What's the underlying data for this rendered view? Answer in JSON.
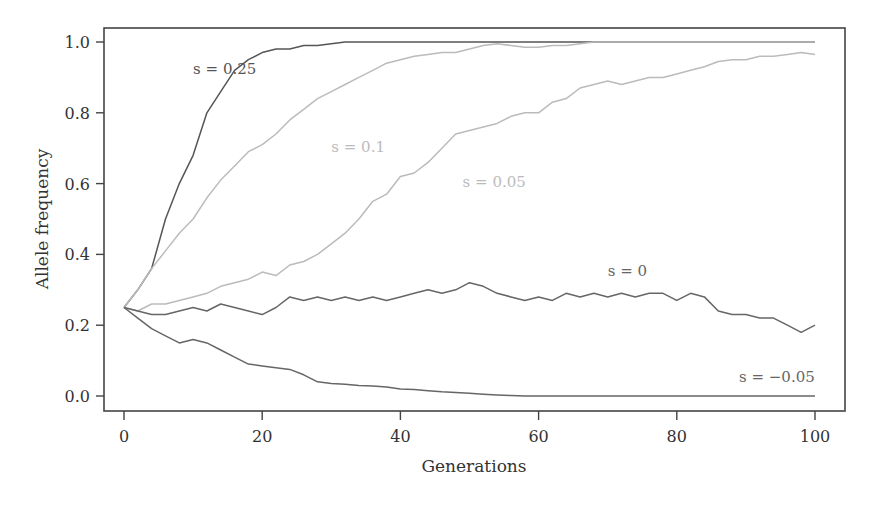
{
  "chart_data": {
    "type": "line",
    "title": "",
    "xlabel": "Generations",
    "ylabel": "Allele frequency",
    "xlim": [
      0,
      100
    ],
    "ylim": [
      0.0,
      1.0
    ],
    "xticks": [
      0,
      20,
      40,
      60,
      80,
      100
    ],
    "yticks": [
      0.0,
      0.2,
      0.4,
      0.6,
      0.8,
      1.0
    ],
    "ytick_labels": [
      "0.0",
      "0.2",
      "0.4",
      "0.6",
      "0.8",
      "1.0"
    ],
    "grid": false,
    "legend": "inline labels",
    "x": [
      0,
      2,
      4,
      6,
      8,
      10,
      12,
      14,
      16,
      18,
      20,
      22,
      24,
      26,
      28,
      30,
      32,
      34,
      36,
      38,
      40,
      42,
      44,
      46,
      48,
      50,
      52,
      54,
      56,
      58,
      60,
      62,
      64,
      66,
      68,
      70,
      72,
      74,
      76,
      78,
      80,
      82,
      84,
      86,
      88,
      90,
      92,
      94,
      96,
      98,
      100
    ],
    "series": [
      {
        "name": "s = 0.25",
        "color": "#555555",
        "label_pos": [
          10,
          0.91
        ],
        "values": [
          0.25,
          0.3,
          0.36,
          0.5,
          0.6,
          0.68,
          0.8,
          0.86,
          0.92,
          0.95,
          0.97,
          0.98,
          0.98,
          0.99,
          0.99,
          0.995,
          1.0,
          1.0,
          1.0,
          1.0,
          1.0,
          1.0,
          1.0,
          1.0,
          1.0,
          1.0,
          1.0,
          1.0,
          1.0,
          1.0,
          1.0,
          1.0,
          1.0,
          1.0,
          1.0,
          1.0,
          1.0,
          1.0,
          1.0,
          1.0,
          1.0,
          1.0,
          1.0,
          1.0,
          1.0,
          1.0,
          1.0,
          1.0,
          1.0,
          1.0,
          1.0
        ]
      },
      {
        "name": "s = 0.1",
        "color": "#bbbbbb",
        "label_pos": [
          30,
          0.69
        ],
        "values": [
          0.25,
          0.3,
          0.36,
          0.41,
          0.46,
          0.5,
          0.56,
          0.61,
          0.65,
          0.69,
          0.71,
          0.74,
          0.78,
          0.81,
          0.84,
          0.86,
          0.88,
          0.9,
          0.92,
          0.94,
          0.95,
          0.96,
          0.965,
          0.97,
          0.97,
          0.98,
          0.99,
          0.995,
          0.99,
          0.985,
          0.985,
          0.99,
          0.99,
          0.995,
          1.0,
          1.0,
          1.0,
          1.0,
          1.0,
          1.0,
          1.0,
          1.0,
          1.0,
          1.0,
          1.0,
          1.0,
          1.0,
          1.0,
          1.0,
          1.0,
          1.0
        ]
      },
      {
        "name": "s = 0.05",
        "color": "#bbbbbb",
        "label_pos": [
          49,
          0.59
        ],
        "values": [
          0.25,
          0.24,
          0.26,
          0.26,
          0.27,
          0.28,
          0.29,
          0.31,
          0.32,
          0.33,
          0.35,
          0.34,
          0.37,
          0.38,
          0.4,
          0.43,
          0.46,
          0.5,
          0.55,
          0.57,
          0.62,
          0.63,
          0.66,
          0.7,
          0.74,
          0.75,
          0.76,
          0.77,
          0.79,
          0.8,
          0.8,
          0.83,
          0.84,
          0.87,
          0.88,
          0.89,
          0.88,
          0.89,
          0.9,
          0.9,
          0.91,
          0.92,
          0.93,
          0.945,
          0.95,
          0.95,
          0.96,
          0.96,
          0.965,
          0.97,
          0.965
        ]
      },
      {
        "name": "s = 0",
        "color": "#666666",
        "label_pos": [
          70,
          0.34
        ],
        "values": [
          0.25,
          0.24,
          0.23,
          0.23,
          0.24,
          0.25,
          0.24,
          0.26,
          0.25,
          0.24,
          0.23,
          0.25,
          0.28,
          0.27,
          0.28,
          0.27,
          0.28,
          0.27,
          0.28,
          0.27,
          0.28,
          0.29,
          0.3,
          0.29,
          0.3,
          0.32,
          0.31,
          0.29,
          0.28,
          0.27,
          0.28,
          0.27,
          0.29,
          0.28,
          0.29,
          0.28,
          0.29,
          0.28,
          0.29,
          0.29,
          0.27,
          0.29,
          0.28,
          0.24,
          0.23,
          0.23,
          0.22,
          0.22,
          0.2,
          0.18,
          0.2
        ]
      },
      {
        "name": "s = −0.05",
        "color": "#666666",
        "label_pos": [
          89,
          0.04
        ],
        "values": [
          0.25,
          0.22,
          0.19,
          0.17,
          0.15,
          0.16,
          0.15,
          0.13,
          0.11,
          0.09,
          0.085,
          0.08,
          0.075,
          0.06,
          0.04,
          0.035,
          0.033,
          0.03,
          0.028,
          0.025,
          0.02,
          0.018,
          0.015,
          0.012,
          0.01,
          0.008,
          0.005,
          0.003,
          0.001,
          0.0,
          0.0,
          0.0,
          0.0,
          0.0,
          0.0,
          0.0,
          0.0,
          0.0,
          0.0,
          0.0,
          0.0,
          0.0,
          0.0,
          0.0,
          0.0,
          0.0,
          0.0,
          0.0,
          0.0,
          0.0,
          0.0
        ]
      }
    ]
  },
  "plot_area": {
    "frame": {
      "left": 104,
      "top": 28,
      "right": 845,
      "bottom": 411
    },
    "x_px": [
      124,
      815
    ],
    "y_px": [
      396,
      42
    ],
    "axis_color": "#444444"
  }
}
